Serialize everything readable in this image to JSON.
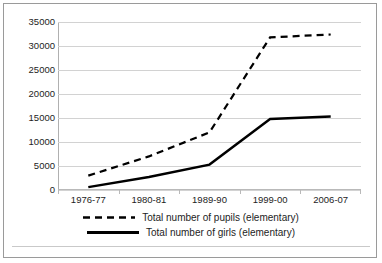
{
  "chart_data": {
    "type": "line",
    "title": "",
    "subtitle": "",
    "xlabel": "",
    "ylabel": "",
    "categories": [
      "1976-77",
      "1980-81",
      "1989-90",
      "1999-00",
      "2006-07"
    ],
    "series": [
      {
        "name": "Total number of pupils (elementary)",
        "style": "dashed",
        "color": "#000000",
        "values": [
          3000,
          7000,
          12000,
          31800,
          32400
        ]
      },
      {
        "name": "Total number of girls (elementary)",
        "style": "solid",
        "color": "#000000",
        "values": [
          600,
          2700,
          5300,
          14800,
          15300
        ]
      }
    ],
    "ylim": [
      0,
      35000
    ],
    "yticks": [
      0,
      5000,
      10000,
      15000,
      20000,
      25000,
      30000,
      35000
    ],
    "ytick_labels": [
      "0",
      "5000",
      "10000",
      "15000",
      "20000",
      "25000",
      "30000",
      "35000"
    ],
    "grid": true,
    "grid_color": "#d2d2d2",
    "legend_position": "bottom",
    "background": "#ffffff",
    "border_color": "#9a9a9a"
  }
}
